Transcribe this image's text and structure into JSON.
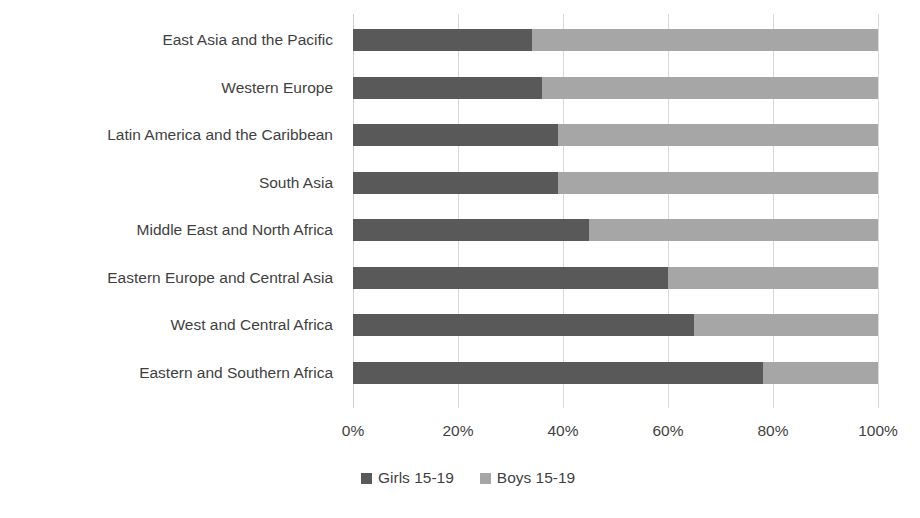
{
  "chart_data": {
    "type": "bar",
    "subtype": "stacked-horizontal-100-percent",
    "title": "",
    "subtitle": "",
    "xlabel": "",
    "ylabel": "",
    "xlim": [
      0,
      100
    ],
    "x_tick_labels": [
      "0%",
      "20%",
      "40%",
      "60%",
      "80%",
      "100%"
    ],
    "x_tick_values": [
      0,
      20,
      40,
      60,
      80,
      100
    ],
    "grid": true,
    "grid_axis": "x",
    "legend_position": "bottom",
    "categories": [
      "East Asia and the Pacific",
      "Western Europe",
      "Latin America and the Caribbean",
      "South Asia",
      "Middle East and North Africa",
      "Eastern Europe and Central Asia",
      "West and Central Africa",
      "Eastern and Southern Africa"
    ],
    "series": [
      {
        "name": "Girls 15-19",
        "color": "#595959",
        "values": [
          34,
          36,
          39,
          39,
          45,
          60,
          65,
          78
        ]
      },
      {
        "name": "Boys 15-19",
        "color": "#a6a6a6",
        "values": [
          66,
          64,
          61,
          61,
          55,
          40,
          35,
          22
        ]
      }
    ]
  },
  "colors": {
    "series_girls": "#595959",
    "series_boys": "#a6a6a6",
    "gridline": "#d9d9d9",
    "text": "#3f3f3f",
    "background": "#ffffff"
  }
}
